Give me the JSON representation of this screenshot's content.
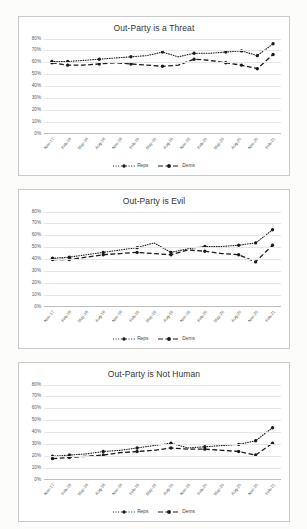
{
  "page": {
    "background": "#fcfcfb",
    "card_background": "#ffffff",
    "card_border": "#c9c9c9",
    "series_color": "#1a1a1a",
    "grid_color": "#e6e6e6"
  },
  "legend": {
    "reps_label": "Reps",
    "dems_label": "Dems"
  },
  "charts": [
    {
      "title": "Out-Party is a Threat",
      "y_ticks": [
        "80%",
        "70%",
        "60%",
        "50%",
        "40%",
        "30%",
        "20%",
        "10%",
        "0%"
      ]
    },
    {
      "title": "Out-Party is Evil",
      "y_ticks": [
        "80%",
        "70%",
        "60%",
        "50%",
        "40%",
        "30%",
        "20%",
        "10%",
        "0%"
      ]
    },
    {
      "title": "Out-Party is Not Human",
      "y_ticks": [
        "80%",
        "70%",
        "60%",
        "50%",
        "40%",
        "30%",
        "20%",
        "10%",
        "0%"
      ]
    }
  ],
  "chart_data": [
    {
      "type": "line",
      "title": "Out-Party is a Threat",
      "xlabel": "",
      "ylabel": "",
      "ylim": [
        0,
        80
      ],
      "yticks": [
        0,
        10,
        20,
        30,
        40,
        50,
        60,
        70,
        80
      ],
      "grid": true,
      "legend_position": "bottom",
      "categories": [
        "Nov-17",
        "Feb-18",
        "May-18",
        "Aug-18",
        "Nov-18",
        "Feb-19",
        "May-19",
        "Aug-19",
        "Nov-19",
        "Feb-20",
        "May-20",
        "Aug-20",
        "Nov-20",
        "Feb-21"
      ],
      "series": [
        {
          "name": "Reps",
          "style": "dotted",
          "values": [
            61,
            61,
            62,
            63,
            64,
            65,
            66,
            69,
            65,
            68,
            68,
            69,
            70,
            66,
            76
          ]
        },
        {
          "name": "Dems",
          "style": "dashed",
          "values": [
            60,
            58,
            58,
            59,
            60,
            59,
            58,
            57,
            58,
            63,
            62,
            60,
            58,
            55,
            67
          ]
        }
      ]
    },
    {
      "type": "line",
      "title": "Out-Party is Evil",
      "xlabel": "",
      "ylabel": "",
      "ylim": [
        0,
        80
      ],
      "yticks": [
        0,
        10,
        20,
        30,
        40,
        50,
        60,
        70,
        80
      ],
      "grid": true,
      "legend_position": "bottom",
      "categories": [
        "Nov-17",
        "Feb-18",
        "May-18",
        "Aug-18",
        "Nov-18",
        "Feb-19",
        "May-19",
        "Aug-19",
        "Nov-19",
        "Feb-20",
        "May-20",
        "Aug-20",
        "Nov-20",
        "Feb-21"
      ],
      "series": [
        {
          "name": "Reps",
          "style": "dotted",
          "values": [
            41,
            42,
            44,
            46,
            48,
            50,
            54,
            46,
            49,
            51,
            51,
            52,
            54,
            65
          ]
        },
        {
          "name": "Dems",
          "style": "dashed",
          "values": [
            40,
            40,
            42,
            44,
            45,
            46,
            45,
            44,
            48,
            47,
            45,
            44,
            38,
            52
          ]
        }
      ]
    },
    {
      "type": "line",
      "title": "Out-Party is Not Human",
      "xlabel": "",
      "ylabel": "",
      "ylim": [
        0,
        80
      ],
      "yticks": [
        0,
        10,
        20,
        30,
        40,
        50,
        60,
        70,
        80
      ],
      "grid": true,
      "legend_position": "bottom",
      "categories": [
        "Nov-17",
        "Feb-18",
        "May-18",
        "Aug-18",
        "Nov-18",
        "Feb-19",
        "May-19",
        "Aug-19",
        "Nov-19",
        "Feb-20",
        "May-20",
        "Aug-20",
        "Nov-20",
        "Feb-21"
      ],
      "series": [
        {
          "name": "Reps",
          "style": "dotted",
          "values": [
            20,
            21,
            22,
            24,
            25,
            27,
            29,
            31,
            27,
            28,
            29,
            30,
            33,
            44
          ]
        },
        {
          "name": "Dems",
          "style": "dashed",
          "values": [
            18,
            19,
            20,
            21,
            23,
            24,
            25,
            27,
            26,
            26,
            25,
            24,
            21,
            31
          ]
        }
      ]
    }
  ]
}
